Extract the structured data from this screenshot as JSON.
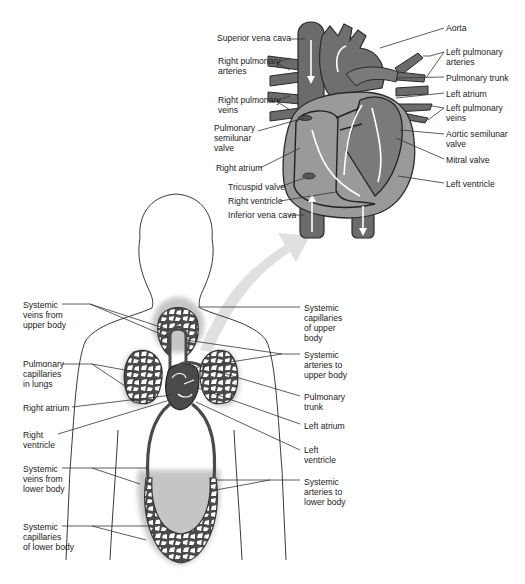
{
  "colors": {
    "vessel": "#6b6b6b",
    "vessel_dark": "#3a3a3a",
    "heart_fill": "#9a9a9a",
    "chamber_fill": "#7d7d7d",
    "capillary_fill": "#4a4a4a",
    "arrow_fill": "#d8d8d8",
    "outline": "#222222",
    "label_text": "#222222"
  },
  "heart_labels": {
    "left_side": [
      {
        "text": "Superior vena cava",
        "x": 217,
        "y": 36
      },
      {
        "text": "Right pulmonary\narteries",
        "x": 218,
        "y": 59
      },
      {
        "text": "Right pulmonary\nveins",
        "x": 218,
        "y": 98
      },
      {
        "text": "Pulmonary\nsemilunar\nvalve",
        "x": 214,
        "y": 126
      },
      {
        "text": "Right atrium",
        "x": 216,
        "y": 164
      },
      {
        "text": "Tricuspid valve",
        "x": 228,
        "y": 184
      },
      {
        "text": "Right ventricle",
        "x": 228,
        "y": 198
      },
      {
        "text": "Inferior vena cava",
        "x": 228,
        "y": 212
      }
    ],
    "right_side": [
      {
        "text": "Aorta",
        "x": 446,
        "y": 25
      },
      {
        "text": "Left pulmonary\narteries",
        "x": 446,
        "y": 49
      },
      {
        "text": "Pulmonary trunk",
        "x": 446,
        "y": 74
      },
      {
        "text": "Left atrium",
        "x": 446,
        "y": 90
      },
      {
        "text": "Left pulmonary\nveins",
        "x": 446,
        "y": 105
      },
      {
        "text": "Aortic semilunar\nvalve",
        "x": 446,
        "y": 131
      },
      {
        "text": "Mitral valve",
        "x": 446,
        "y": 156
      },
      {
        "text": "Left ventricle",
        "x": 446,
        "y": 180
      }
    ]
  },
  "body_labels": {
    "left_side": [
      {
        "text": "Systemic\nveins from\nupper body",
        "x": 23,
        "y": 300
      },
      {
        "text": "Pulmonary\ncapillaries\nin lungs",
        "x": 23,
        "y": 359
      },
      {
        "text": "Right atrium",
        "x": 23,
        "y": 402
      },
      {
        "text": "Right\nventricle",
        "x": 23,
        "y": 429
      },
      {
        "text": "Systemic\nveins from\nlower body",
        "x": 23,
        "y": 463
      },
      {
        "text": "Systemic\ncapillaries\nof lower body",
        "x": 23,
        "y": 521
      }
    ],
    "right_side": [
      {
        "text": "Systemic\ncapillaries\nof upper\nbody",
        "x": 304,
        "y": 303
      },
      {
        "text": "Systemic\narteries to\nupper body",
        "x": 304,
        "y": 349
      },
      {
        "text": "Pulmonary\ntrunk",
        "x": 304,
        "y": 391
      },
      {
        "text": "Left atrium",
        "x": 304,
        "y": 421
      },
      {
        "text": "Left\nventricle",
        "x": 304,
        "y": 444
      },
      {
        "text": "Systemic\narteries to\nlower body",
        "x": 304,
        "y": 476
      }
    ]
  }
}
